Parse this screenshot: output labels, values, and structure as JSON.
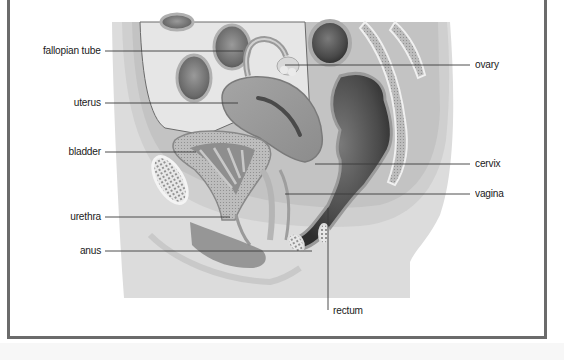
{
  "diagram": {
    "colors": {
      "frame_border": "#6b6b6b",
      "background": "#ffffff",
      "label_text": "#1a1a1a",
      "leader_line": "#3a3a3a",
      "tissue_light": "#d9d9d9",
      "tissue_mid": "#a8a8a8",
      "organ_dark": "#4a4a4a"
    },
    "labels": [
      {
        "id": "fallopian-tube",
        "text": "fallopian tube",
        "side": "left",
        "text_x": 101,
        "text_y": 51,
        "line": {
          "x1": 105,
          "y1": 51,
          "x2": 243,
          "y2": 51
        }
      },
      {
        "id": "uterus",
        "text": "uterus",
        "side": "left",
        "text_x": 101,
        "text_y": 103,
        "line": {
          "x1": 105,
          "y1": 103,
          "x2": 238,
          "y2": 103
        }
      },
      {
        "id": "bladder",
        "text": "bladder",
        "side": "left",
        "text_x": 101,
        "text_y": 152,
        "line": {
          "x1": 105,
          "y1": 152,
          "x2": 196,
          "y2": 152
        }
      },
      {
        "id": "urethra",
        "text": "urethra",
        "side": "left",
        "text_x": 101,
        "text_y": 217,
        "line": {
          "x1": 105,
          "y1": 217,
          "x2": 230,
          "y2": 217
        }
      },
      {
        "id": "anus",
        "text": "anus",
        "side": "left",
        "text_x": 101,
        "text_y": 251,
        "line": {
          "x1": 105,
          "y1": 251,
          "x2": 312,
          "y2": 251
        }
      },
      {
        "id": "ovary",
        "text": "ovary",
        "side": "right",
        "text_x": 475,
        "text_y": 65,
        "line": {
          "x1": 285,
          "y1": 65,
          "x2": 470,
          "y2": 65
        }
      },
      {
        "id": "cervix",
        "text": "cervix",
        "side": "right",
        "text_x": 475,
        "text_y": 164,
        "line": {
          "x1": 315,
          "y1": 164,
          "x2": 470,
          "y2": 164
        }
      },
      {
        "id": "vagina",
        "text": "vagina",
        "side": "right",
        "text_x": 475,
        "text_y": 194,
        "line": {
          "x1": 285,
          "y1": 194,
          "x2": 470,
          "y2": 194
        }
      },
      {
        "id": "rectum",
        "text": "rectum",
        "side": "below",
        "text_x": 333,
        "text_y": 311,
        "line": {
          "x1": 328,
          "y1": 208,
          "x2": 328,
          "y2": 310
        }
      }
    ]
  }
}
